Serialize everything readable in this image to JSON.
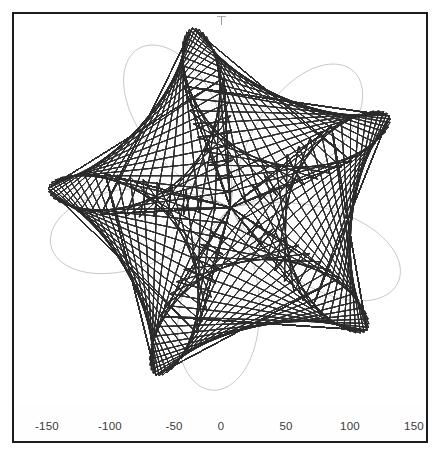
{
  "figure": {
    "background_color": "#ffffff",
    "frame_color": "#1c1c1c",
    "curve_color": "#2b2b2b",
    "label_color": "#3a3a3a"
  },
  "axis": {
    "tick_labels": [
      "-150",
      "-100",
      "-50",
      "0",
      "50",
      "100",
      "150"
    ],
    "tick_values": [
      -150,
      -100,
      -50,
      0,
      50,
      100,
      150
    ],
    "tick_positions_px": [
      33,
      96,
      160,
      207,
      272,
      336,
      400
    ]
  },
  "chart_data": {
    "type": "line",
    "title": "",
    "subtitle": "",
    "xlabel": "",
    "ylabel": "",
    "xlim": [
      -175,
      175
    ],
    "ylim": [
      -175,
      175
    ],
    "xticks": [
      -150,
      -100,
      -50,
      0,
      50,
      100,
      150
    ],
    "xticklabels": [
      "-150",
      "-100",
      "-50",
      "0",
      "50",
      "100",
      "150"
    ],
    "yticks": [],
    "yticklabels": [],
    "grid": false,
    "legend": false,
    "legend_position": "none",
    "series": [
      {
        "name": "maurer-rose",
        "curve_family": "maurer_rose",
        "petals_visible": 5,
        "max_radius": 150,
        "center": [
          0,
          0
        ],
        "line_color": "#2b2b2b",
        "line_width": 0.35,
        "samples": 4000,
        "params": {
          "n": 5,
          "d": 97,
          "amplitude": 150,
          "rotation_deg": 12,
          "degrees_step": 1,
          "total_degrees": 3600
        }
      }
    ],
    "annotations": [
      {
        "label": "start-marker",
        "x": 0,
        "y": 150
      }
    ]
  }
}
